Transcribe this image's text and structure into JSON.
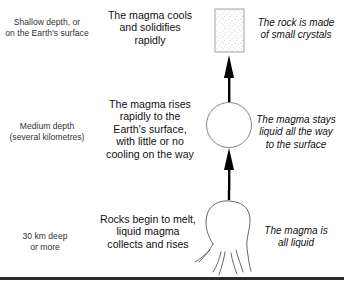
{
  "diagram": {
    "type": "process-flow",
    "direction": "bottom-to-top",
    "stages": [
      {
        "depth_label": "Shallow depth, or\non the Earth's surface",
        "process": "The magma cools\nand solidifies\nrapidly",
        "result": "The rock is made\nof small crystals",
        "shape": "stippled-square"
      },
      {
        "depth_label": "Medium depth\n(several kilometres)",
        "process": "The magma rises\nrapidly to the\nEarth's surface,\nwith little or no\ncooling on the way",
        "result": "The magma stays\nliquid all the way\nto the surface",
        "shape": "circle"
      },
      {
        "depth_label": "30 km deep\nor more",
        "process": "Rocks begin to melt,\nliquid magma\ncollects and rises",
        "result": "The magma is\nall liquid",
        "shape": "magma-blob"
      }
    ],
    "colors": {
      "ink": "#111111",
      "shape_outline": "#666666",
      "stipple": "#888888",
      "rule": "#2a2a2a"
    }
  }
}
